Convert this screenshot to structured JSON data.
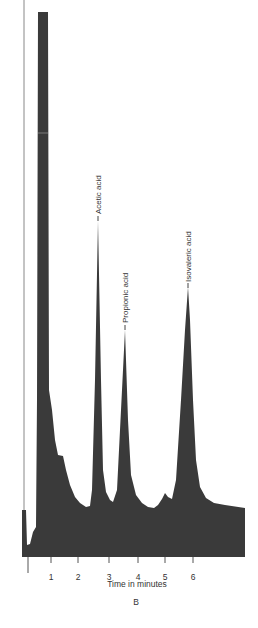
{
  "chart_data": {
    "type": "area",
    "title": "",
    "panel_label": "B",
    "xlabel": "Time in minutes",
    "ylabel": "",
    "x_ticks": [
      1,
      2,
      3,
      4,
      5,
      6
    ],
    "xlim": [
      -0.2,
      7.6
    ],
    "grid": false,
    "legend": null,
    "fill_color": "#3a3a3a",
    "peaks": [
      {
        "name": "Solvent",
        "time_min": 0.6,
        "relative_height": 1.0,
        "labeled": false,
        "note": "off-scale"
      },
      {
        "name": "Acetic acid",
        "time_min": 2.7,
        "relative_height": 0.62,
        "labeled": true
      },
      {
        "name": "Propionic acid",
        "time_min": 3.5,
        "relative_height": 0.42,
        "labeled": true
      },
      {
        "name": "Unlabeled minor peak",
        "time_min": 4.95,
        "relative_height": 0.11,
        "labeled": false
      },
      {
        "name": "Isovaleric acid",
        "time_min": 5.85,
        "relative_height": 0.5,
        "labeled": true
      }
    ],
    "baseline_relative": 0.09
  },
  "render": {
    "trace_path": "M22,557 L22,510 L26,510 L27,545 L30,544 L33,532 L36,527 L37,400 L38,12 L48,12 L49,390 L52,410 L55,440 L58,455 L63,456 L66,470 L70,485 L75,497 L80,503 L86,507 L90,506 L92,490 L95,380 L98,221 L101,380 L103,470 L106,492 L110,500 L113,502 L117,490 L120,430 L125,330 L128,420 L131,475 L136,495 L142,503 L148,507 L154,508 L158,505 L162,499 L165,493 L168,497 L172,499 L176,480 L181,400 L185,330 L188,287 L190,320 L193,400 L196,460 L200,487 L206,498 L214,503 L225,505 L245,508 L245,557 Z",
    "left_axis_line": {
      "x": 24,
      "y1": 0,
      "y2": 557
    },
    "axis_start_line": {
      "x": 28,
      "y1": 557,
      "y2": 573
    },
    "tick_positions": [
      51,
      78,
      109,
      138,
      165,
      193
    ],
    "tick_y": [
      557,
      563
    ],
    "tick_label_y": 574,
    "xlabel_pos": {
      "x": 137,
      "y": 587
    },
    "panel_label_pos": {
      "x": 136,
      "y": 605
    },
    "peak_labels": [
      {
        "text": "Acetic acid",
        "x": 98,
        "y_bottom": 214,
        "marker_y1": 216,
        "marker_y2": 221
      },
      {
        "text": "Propionic acid",
        "x": 125,
        "y_bottom": 323,
        "marker_y1": 325,
        "marker_y2": 330
      },
      {
        "text": "Isovaleric acid",
        "x": 188,
        "y_bottom": 282,
        "marker_y1": 283,
        "marker_y2": 288
      }
    ],
    "scan_line_y": 133
  }
}
